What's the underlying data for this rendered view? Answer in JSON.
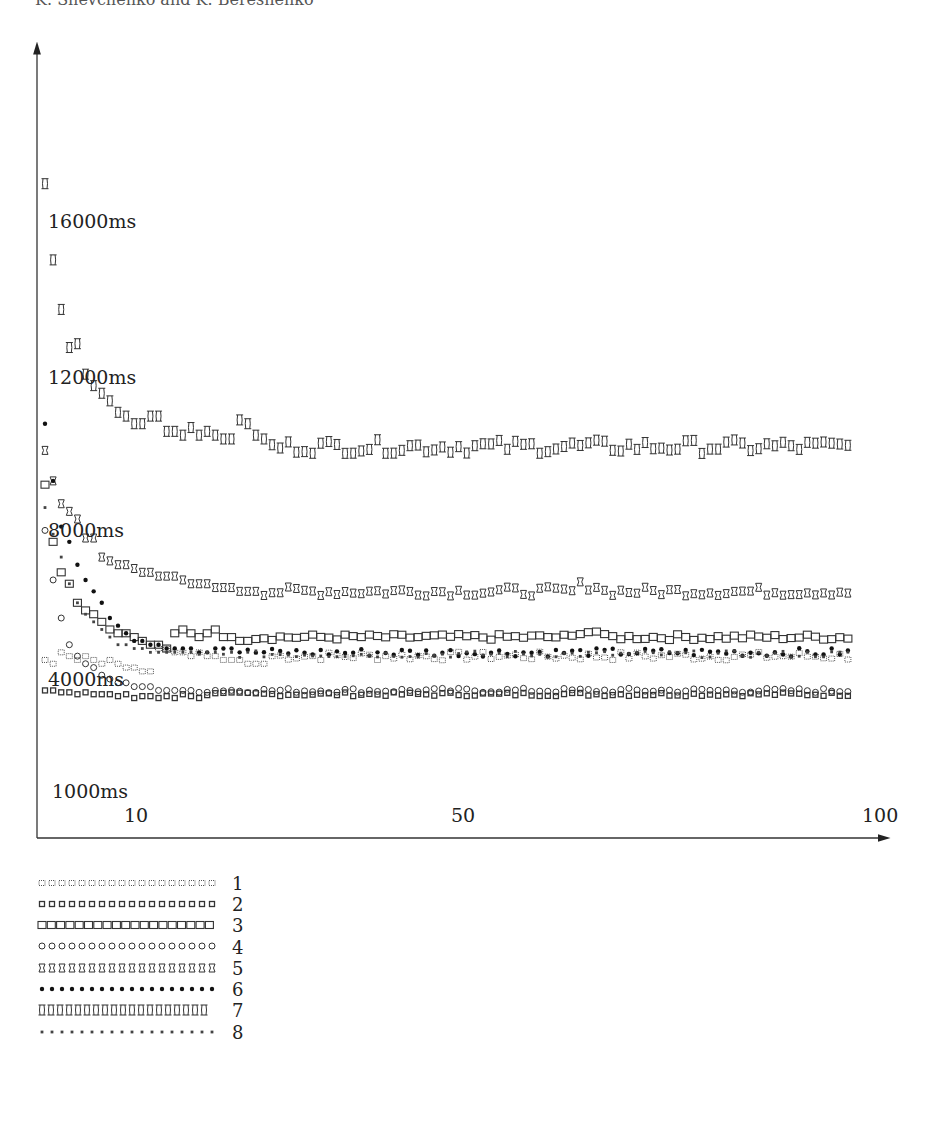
{
  "page": {
    "header_fragment": "K. Shevchenko and K. Bereshenko"
  },
  "chart_data": {
    "type": "scatter",
    "title": "",
    "xlabel": "",
    "ylabel": "",
    "x_ticks": [
      {
        "label": "10",
        "value": 10
      },
      {
        "label": "50",
        "value": 50
      },
      {
        "label": "100",
        "value": 100
      }
    ],
    "y_ticks": [
      {
        "label": "16000ms",
        "value": 16000
      },
      {
        "label": "12000ms",
        "value": 12000
      },
      {
        "label": "8000ms",
        "value": 8000
      },
      {
        "label": "4000ms",
        "value": 4000
      },
      {
        "label": "1000ms",
        "value": 1000
      }
    ],
    "xlim": [
      0,
      100
    ],
    "ylim": [
      1000,
      19000
    ],
    "grid": false,
    "legend_position": "below-left",
    "series": [
      {
        "name": "1",
        "marker": "dotted-square",
        "start": [
          4500,
          4400,
          4700,
          4600,
          4500,
          4600,
          4500,
          4400,
          4500,
          4400,
          4300,
          4300,
          4200,
          4200,
          4800,
          4800,
          4700,
          4700,
          4600,
          4700,
          4600,
          4600,
          4500,
          4500,
          4500,
          4400,
          4400,
          4400
        ],
        "plateau": 4600,
        "noise": 120
      },
      {
        "name": "2",
        "marker": "small-square",
        "start": [
          3700,
          3700,
          3650,
          3650,
          3600,
          3650,
          3600,
          3600,
          3600,
          3550,
          3600,
          3500,
          3550,
          3550,
          3500,
          3550,
          3500,
          3600,
          3550,
          3500
        ],
        "plateau": 3600,
        "noise": 50
      },
      {
        "name": "3",
        "marker": "square",
        "start": [
          9100,
          7600,
          6800,
          6500,
          6000,
          5800,
          5700,
          5500,
          5300,
          5200,
          5200,
          5100,
          5000,
          4900,
          4900,
          4800,
          5200,
          5300,
          5200,
          5100,
          5200,
          5300,
          5100,
          5100,
          5000,
          5000
        ],
        "plateau": 5100,
        "noise": 80
      },
      {
        "name": "4",
        "marker": "circle",
        "start": [
          7900,
          6600,
          5600,
          4900,
          4600,
          4400,
          4300,
          4100,
          4000,
          3900,
          3900,
          3800,
          3800,
          3800,
          3700,
          3700,
          3700,
          3700,
          3700,
          3650,
          3650,
          3700
        ],
        "plateau": 3700,
        "noise": 60
      },
      {
        "name": "5",
        "marker": "hourglass-box",
        "start": [
          10000,
          9200,
          8600,
          8400,
          8200,
          7700,
          7700,
          7200,
          7100,
          7000,
          7000,
          6900,
          6800,
          6800,
          6700,
          6700,
          6700,
          6600,
          6500,
          6500,
          6500,
          6400,
          6400,
          6400,
          6300,
          6300,
          6300
        ],
        "plateau": 6300,
        "noise": 120
      },
      {
        "name": "6",
        "marker": "filled-dot",
        "start": [
          10700,
          9200,
          8000,
          7600,
          7000,
          6600,
          6300,
          6000,
          5600,
          5400,
          5200,
          5000,
          5000,
          4900,
          4900,
          4800,
          4800,
          4800,
          4800,
          4700,
          4700,
          4800,
          4800,
          4800,
          4700
        ],
        "plateau": 4700,
        "noise": 110
      },
      {
        "name": "7",
        "marker": "double-loop",
        "start": [
          17000,
          15000,
          13700,
          12700,
          12800,
          12000,
          11700,
          11500,
          11300,
          11000,
          10900,
          10700,
          10700,
          10900,
          10900,
          10500,
          10500,
          10400,
          10600,
          10400,
          10500,
          10400,
          10300,
          10300,
          10800,
          10700,
          10400,
          10300
        ],
        "plateau": 10100,
        "noise": 180
      },
      {
        "name": "8",
        "marker": "small-dot",
        "start": [
          8500,
          7800,
          7200,
          6500,
          6000,
          5700,
          5500,
          5300,
          5100,
          4900,
          4900,
          4800,
          4800,
          4700,
          4700,
          4700,
          4700,
          4700,
          4700,
          4650,
          4700,
          4700,
          4650,
          4700
        ],
        "plateau": 4650,
        "noise": 90
      }
    ]
  },
  "legend": {
    "items": [
      {
        "label": "1"
      },
      {
        "label": "2"
      },
      {
        "label": "3"
      },
      {
        "label": "4"
      },
      {
        "label": "5"
      },
      {
        "label": "6"
      },
      {
        "label": "7"
      },
      {
        "label": "8"
      }
    ]
  }
}
